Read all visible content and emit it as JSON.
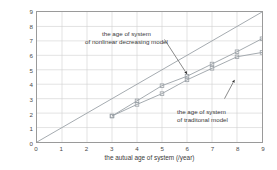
{
  "chart_data": {
    "type": "scatter",
    "title": "",
    "xlabel": "the autual age of system (/year)",
    "ylabel": "the equivalent age of system (/year)",
    "xlim": [
      0,
      9
    ],
    "ylim": [
      0,
      9
    ],
    "xticks": [
      0,
      1,
      2,
      3,
      4,
      5,
      6,
      7,
      8,
      9
    ],
    "yticks": [
      0,
      1,
      2,
      3,
      4,
      5,
      6,
      7,
      8,
      9
    ],
    "grid": true,
    "legend_position": "in-plot annotations",
    "series": [
      {
        "name": "reference line y = x",
        "type": "line",
        "color": "#9aa0a6",
        "x": [
          0,
          9
        ],
        "y": [
          0,
          9
        ],
        "markers": false
      },
      {
        "name": "the age of system of nonlinear decreasing model",
        "type": "line+markers",
        "color": "#9aa0a6",
        "marker": "square",
        "x": [
          3,
          4,
          5,
          6,
          7,
          8,
          9
        ],
        "y": [
          1.8,
          2.85,
          3.9,
          4.55,
          5.4,
          6.25,
          7.15
        ]
      },
      {
        "name": "the age of system of traditonal model",
        "type": "line+markers",
        "color": "#9aa0a6",
        "marker": "square",
        "x": [
          3,
          4,
          5,
          6,
          7,
          8,
          9
        ],
        "y": [
          1.8,
          2.6,
          3.35,
          4.3,
          5.1,
          5.9,
          6.2
        ]
      }
    ],
    "annotations": [
      {
        "name": "nonlinear-model-callout",
        "line1": "the age of system",
        "line2": "of nonlinear decreasing model",
        "arrow_from": [
          5.1,
          7.1
        ],
        "arrow_to": [
          6.0,
          4.7
        ]
      },
      {
        "name": "traditional-model-callout",
        "line1": "the age of system",
        "line2": "of traditonal model",
        "arrow_from": [
          7.5,
          3.0
        ],
        "arrow_to": [
          7.9,
          4.3
        ]
      }
    ]
  },
  "axis": {
    "x_tick_labels": [
      "0",
      "1",
      "2",
      "3",
      "4",
      "5",
      "6",
      "7",
      "8",
      "9"
    ],
    "y_tick_labels": [
      "0",
      "1",
      "2",
      "3",
      "4",
      "5",
      "6",
      "7",
      "8",
      "9"
    ],
    "x_title": "the autual age of system (/year)",
    "y_title": "the equivalent age of system (/year)"
  },
  "annotations": {
    "nonlinear": {
      "line1": "the age of system",
      "line2": "of nonlinear decreasing model"
    },
    "traditional": {
      "line1": "the age of system",
      "line2": "of traditonal model"
    }
  },
  "colors": {
    "axis": "#9a9a9a",
    "grid": "#cfcfcf",
    "series": "#9aa0a6",
    "text": "#3a3a3a",
    "background": "#ffffff"
  }
}
